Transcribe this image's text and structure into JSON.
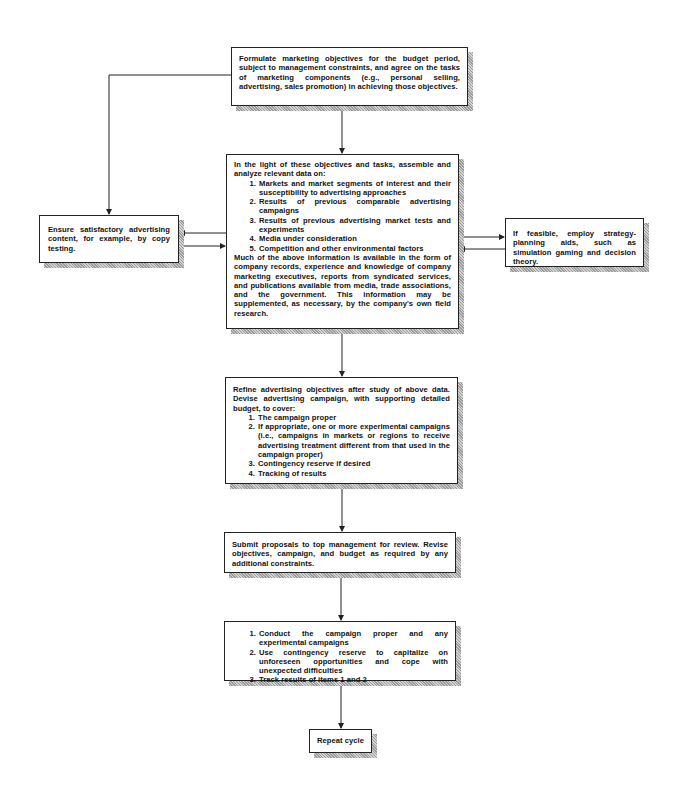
{
  "diagram": {
    "type": "flowchart",
    "boxes": {
      "formulate": {
        "text": "Formulate marketing objectives for the budget period, subject to management constraints, and agree on the tasks of marketing components (e.g., personal selling, advertising, sales promotion) in achieving those objectives."
      },
      "analyze": {
        "intro": "In the light of these objectives and tasks, assemble and analyze relevant data on:",
        "items": [
          "Markets and market segments of interest and their susceptibility to advertising approaches",
          "Results of previous comparable advertising campaigns",
          "Results of previous advertising market tests and experiments",
          "Media under consideration",
          "Competition and other environmental factors"
        ],
        "outro": "Much of the above information is available in the form of company records, experience and knowledge of company marketing executives, reports from syndicated services, and publications available from media, trade associations, and the government. This information may be supplemented, as necessary, by the company's own field research."
      },
      "ensure": {
        "text": "Ensure satisfactory advertising content, for example, by copy testing."
      },
      "planning_aids": {
        "text": "If feasible, employ strategy-planning aids, such as simulation gaming and decision theory."
      },
      "refine": {
        "intro": "Refine advertising objectives after study of above data. Devise advertising campaign, with supporting detailed budget, to cover:",
        "items": [
          "The campaign proper",
          "If appropriate, one or more experimental campaigns (i.e., campaigns in markets or regions to receive advertising treatment different from that used in the campaign proper)",
          "Contingency reserve if desired",
          "Tracking of results"
        ]
      },
      "submit": {
        "text": "Submit proposals to top management for review. Revise objectives, campaign, and budget as required by any additional constraints."
      },
      "conduct": {
        "items": [
          "Conduct the campaign proper and any experimental campaigns",
          "Use contingency reserve to capitalize on unforeseen opportunities and cope with unexpected difficulties",
          "Track results of items 1 and 2"
        ]
      },
      "repeat": {
        "text": "Repeat cycle"
      }
    },
    "edges": [
      {
        "from": "formulate",
        "to": "analyze"
      },
      {
        "from": "formulate",
        "to": "ensure"
      },
      {
        "from": "analyze",
        "to": "ensure"
      },
      {
        "from": "ensure",
        "to": "analyze"
      },
      {
        "from": "analyze",
        "to": "planning_aids"
      },
      {
        "from": "planning_aids",
        "to": "analyze"
      },
      {
        "from": "analyze",
        "to": "refine"
      },
      {
        "from": "refine",
        "to": "submit"
      },
      {
        "from": "submit",
        "to": "conduct"
      },
      {
        "from": "conduct",
        "to": "repeat"
      }
    ],
    "colors": {
      "line": "#222222",
      "box_fill": "#ffffff",
      "shadow": "#b0b0b0"
    }
  }
}
